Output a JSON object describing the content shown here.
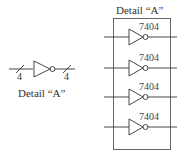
{
  "left_detail": {
    "label": "Detail “A”",
    "bus_width_in": "4",
    "bus_width_out": "4"
  },
  "right_detail": {
    "title": "Detail “A”",
    "gates": [
      {
        "part": "7404"
      },
      {
        "part": "7404"
      },
      {
        "part": "7404"
      },
      {
        "part": "7404"
      }
    ]
  }
}
